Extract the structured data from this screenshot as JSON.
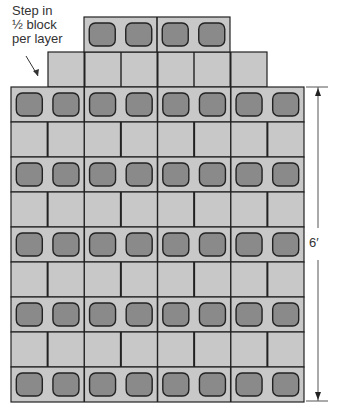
{
  "annotation": {
    "lines": [
      "Step in",
      "½ block",
      "per layer"
    ]
  },
  "dimension": {
    "label": "6′",
    "x": 318,
    "top": 87,
    "bottom": 401
  },
  "colors": {
    "face": "#c8c8c8",
    "cell": "#8a8a8a",
    "stroke": "#222222",
    "dim": "#555555"
  },
  "wall": {
    "left": 11,
    "right": 304,
    "top": 87,
    "row_height": 35,
    "rows": 9,
    "blocks_per_row": 4
  },
  "step_layers": [
    {
      "name": "second-layer",
      "left": 48,
      "right": 267,
      "top": 52,
      "height": 35,
      "type": "face"
    },
    {
      "name": "top-layer",
      "left": 84,
      "right": 230,
      "top": 17,
      "height": 35,
      "type": "cells"
    }
  ],
  "arrow": {
    "x1": 26,
    "y1": 56,
    "x2": 38,
    "y2": 76
  }
}
